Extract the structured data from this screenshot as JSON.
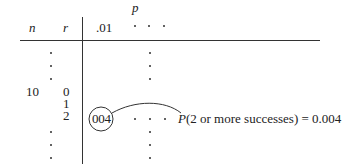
{
  "table": {
    "param_label": "p",
    "col_n_header": "n",
    "col_r_header": "r",
    "first_p_column": ".01",
    "n_value": "10",
    "r_values": [
      "0",
      "1",
      "2"
    ],
    "highlighted_entry": "004"
  },
  "annotation": {
    "func": "P",
    "text": "(2 or more successes) = 0.004"
  }
}
